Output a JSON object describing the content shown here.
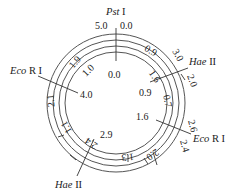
{
  "diagram": {
    "type": "plasmid-restriction-map",
    "rings": 4,
    "enzymes": [
      {
        "id": "pst1",
        "name_italic": "Pst",
        "name_roman": " I",
        "label": "Pst I"
      },
      {
        "id": "hae2_top",
        "name_italic": "Hae",
        "name_roman": " II",
        "label": "Hae II"
      },
      {
        "id": "ecor1_right",
        "name_italic": "Eco",
        "name_roman": " R I",
        "label": "Eco R I"
      },
      {
        "id": "hae2_bottom",
        "name_italic": "Hae",
        "name_roman": " II",
        "label": "Hae II"
      },
      {
        "id": "ecor1_left",
        "name_italic": "Eco",
        "name_roman": " R I",
        "label": "Eco R I"
      }
    ],
    "position_labels": {
      "top_left_outer": "5.0",
      "top_right_outer": "0.0",
      "top_inner": "0.0",
      "hae_top_outer_a": "3.0",
      "hae_top_outer_b": "2.0",
      "hae_top_inner": "0.9",
      "ecor_right_outer_a": "2.6",
      "ecor_right_outer_b": "2.4",
      "ecor_right_inner": "1.6",
      "hae_bottom_inner": "2.9",
      "ecor_left_inner": "4.0"
    },
    "segment_labels": {
      "ring3_upper_left": "1.9",
      "ring2_upper_left": "1.0",
      "ring3_upper_right": "0.9",
      "ring2_right_upper": "1.6",
      "ring2_right": "0.7",
      "ring4_left": "2.1",
      "ring3_lower_left": "1.1",
      "ring2_bottom_left": "2.4",
      "ring2_bottom": "1.3",
      "ring3_bottom_right": "2.0"
    }
  }
}
